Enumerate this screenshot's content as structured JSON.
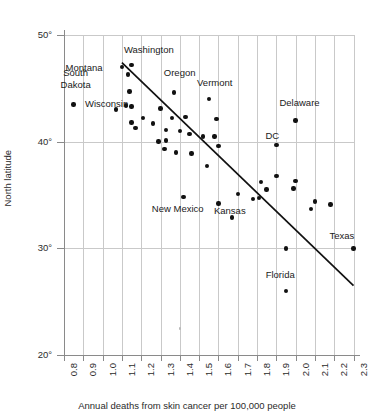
{
  "chart_data": {
    "type": "scatter",
    "title": "",
    "xlabel": "Annual deaths from skin cancer per 100,000 people",
    "ylabel": "North latitude",
    "xlim": [
      0.8,
      2.3
    ],
    "ylim": [
      20,
      50
    ],
    "grid": true,
    "legend": "none",
    "xticks": [
      "0.8",
      "0.9",
      "1.0",
      "1.1",
      "1.2",
      "1.3",
      "1.4",
      "1.5",
      "1.6",
      "1.7",
      "1.8",
      "1.9",
      "2.0",
      "2.1",
      "2.2",
      "2.3"
    ],
    "xtick_values": [
      0.8,
      0.9,
      1.0,
      1.1,
      1.2,
      1.3,
      1.4,
      1.5,
      1.6,
      1.7,
      1.8,
      1.9,
      2.0,
      2.1,
      2.2,
      2.3
    ],
    "yticks": [
      "50°",
      "40°",
      "30°",
      "20°"
    ],
    "ytick_values": [
      50,
      40,
      30,
      20
    ],
    "points": [
      {
        "x": 0.85,
        "y": 43.5,
        "label": "South Dakota"
      },
      {
        "x": 1.1,
        "y": 47.0,
        "label": "Montana"
      },
      {
        "x": 1.15,
        "y": 47.2,
        "label": "Washington"
      },
      {
        "x": 1.13,
        "y": 46.3,
        "label": ""
      },
      {
        "x": 1.14,
        "y": 44.7,
        "label": ""
      },
      {
        "x": 1.12,
        "y": 43.4,
        "label": ""
      },
      {
        "x": 1.15,
        "y": 43.3,
        "label": ""
      },
      {
        "x": 1.07,
        "y": 43.0,
        "label": "Wisconsin"
      },
      {
        "x": 1.15,
        "y": 41.8,
        "label": ""
      },
      {
        "x": 1.17,
        "y": 41.3,
        "label": ""
      },
      {
        "x": 1.21,
        "y": 42.2,
        "label": ""
      },
      {
        "x": 1.26,
        "y": 41.7,
        "label": ""
      },
      {
        "x": 1.3,
        "y": 43.1,
        "label": ""
      },
      {
        "x": 1.37,
        "y": 44.6,
        "label": "Oregon"
      },
      {
        "x": 1.36,
        "y": 42.2,
        "label": ""
      },
      {
        "x": 1.43,
        "y": 42.3,
        "label": ""
      },
      {
        "x": 1.55,
        "y": 44.0,
        "label": "Vermont"
      },
      {
        "x": 1.33,
        "y": 41.1,
        "label": ""
      },
      {
        "x": 1.29,
        "y": 40.0,
        "label": ""
      },
      {
        "x": 1.33,
        "y": 40.1,
        "label": ""
      },
      {
        "x": 1.32,
        "y": 39.3,
        "label": ""
      },
      {
        "x": 1.38,
        "y": 39.0,
        "label": ""
      },
      {
        "x": 1.4,
        "y": 41.0,
        "label": ""
      },
      {
        "x": 1.45,
        "y": 40.7,
        "label": ""
      },
      {
        "x": 1.46,
        "y": 38.9,
        "label": ""
      },
      {
        "x": 1.52,
        "y": 40.5,
        "label": ""
      },
      {
        "x": 1.58,
        "y": 40.5,
        "label": ""
      },
      {
        "x": 1.59,
        "y": 42.1,
        "label": ""
      },
      {
        "x": 1.6,
        "y": 39.6,
        "label": ""
      },
      {
        "x": 1.54,
        "y": 37.7,
        "label": ""
      },
      {
        "x": 1.42,
        "y": 34.8,
        "label": "New Mexico"
      },
      {
        "x": 1.6,
        "y": 34.2,
        "label": ""
      },
      {
        "x": 1.67,
        "y": 32.9,
        "label": "Kansas"
      },
      {
        "x": 1.7,
        "y": 35.1,
        "label": ""
      },
      {
        "x": 1.78,
        "y": 34.6,
        "label": ""
      },
      {
        "x": 1.81,
        "y": 34.7,
        "label": ""
      },
      {
        "x": 1.82,
        "y": 36.2,
        "label": ""
      },
      {
        "x": 1.85,
        "y": 35.5,
        "label": ""
      },
      {
        "x": 1.9,
        "y": 39.7,
        "label": "DC"
      },
      {
        "x": 1.9,
        "y": 36.8,
        "label": ""
      },
      {
        "x": 1.95,
        "y": 30.0,
        "label": ""
      },
      {
        "x": 1.95,
        "y": 26.0,
        "label": "Florida"
      },
      {
        "x": 2.0,
        "y": 42.0,
        "label": "Delaware"
      },
      {
        "x": 1.99,
        "y": 35.6,
        "label": ""
      },
      {
        "x": 2.0,
        "y": 36.3,
        "label": ""
      },
      {
        "x": 2.08,
        "y": 33.7,
        "label": ""
      },
      {
        "x": 2.1,
        "y": 34.4,
        "label": ""
      },
      {
        "x": 2.18,
        "y": 34.1,
        "label": ""
      },
      {
        "x": 2.3,
        "y": 30.0,
        "label": "Texas"
      },
      {
        "x": 1.4,
        "y": 22.5,
        "label": "",
        "faint": true
      }
    ],
    "trendline": {
      "x_start": 1.1,
      "y_start": 47.4,
      "x_end": 2.3,
      "y_end": 26.5
    },
    "annotations": [
      {
        "text": "South\nDakota",
        "x": 0.86,
        "y": 45.9,
        "align": "center"
      },
      {
        "text": "Montana",
        "x": 1.0,
        "y": 46.9,
        "align": "right"
      },
      {
        "text": "Washington",
        "x": 1.24,
        "y": 48.6,
        "align": "center"
      },
      {
        "text": "Oregon",
        "x": 1.4,
        "y": 46.4,
        "align": "center"
      },
      {
        "text": "Vermont",
        "x": 1.58,
        "y": 45.5,
        "align": "center"
      },
      {
        "text": "Wisconsin",
        "x": 1.02,
        "y": 43.5,
        "align": "center"
      },
      {
        "text": "Delaware",
        "x": 2.02,
        "y": 43.6,
        "align": "center"
      },
      {
        "text": "DC",
        "x": 1.88,
        "y": 40.5,
        "align": "center"
      },
      {
        "text": "New Mexico",
        "x": 1.39,
        "y": 33.7,
        "align": "center"
      },
      {
        "text": "Kansas",
        "x": 1.66,
        "y": 33.5,
        "align": "center"
      },
      {
        "text": "Texas",
        "x": 2.24,
        "y": 31.2,
        "align": "center"
      },
      {
        "text": "Florida",
        "x": 1.92,
        "y": 27.5,
        "align": "center"
      }
    ]
  },
  "colors": {
    "point": "#111111",
    "grid": "#c9c9c9",
    "axis": "#8a8a8a",
    "trendline": "#111111",
    "text": "#1a1a1a",
    "background": "#ffffff"
  }
}
